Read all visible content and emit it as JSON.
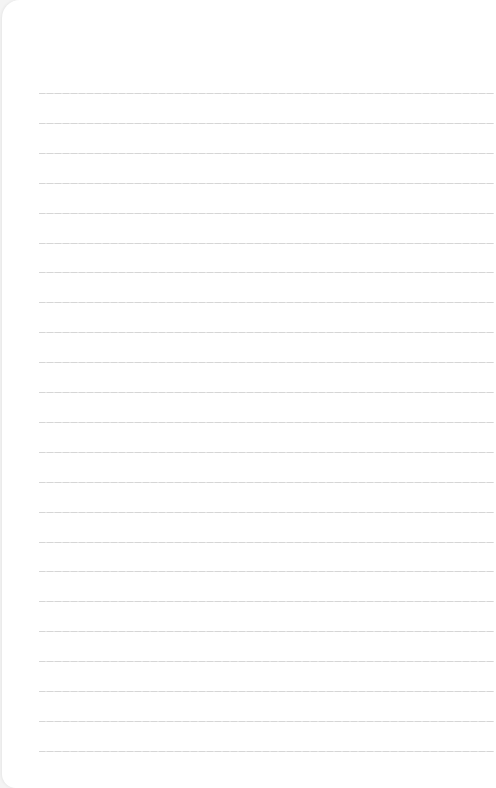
{
  "page": {
    "type": "lined-paper",
    "background_color": "#ffffff",
    "rule_color": "#d6d6d6",
    "rule_count": 23,
    "first_rule_y": 93,
    "rule_spacing": 29.9
  }
}
